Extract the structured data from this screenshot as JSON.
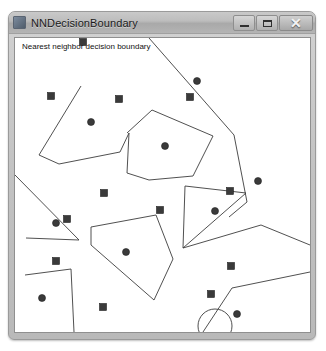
{
  "window": {
    "title": "NNDecisionBoundary",
    "icon": "app-icon",
    "controls": {
      "minimize_label": "–",
      "maximize_label": "□",
      "close_label": "✕"
    }
  },
  "canvas": {
    "label": "Nearest neighbor decision boundary",
    "width": 295,
    "height": 294,
    "background_color": "#ffffff",
    "boundary_color": "#3c3c3c",
    "point_color": "#3a3a3a"
  },
  "chart_data": {
    "type": "scatter",
    "title": "Nearest neighbor decision boundary",
    "xlabel": "",
    "ylabel": "",
    "xlim": [
      0,
      295
    ],
    "ylim": [
      0,
      294
    ],
    "grid": false,
    "legend": "none",
    "series": [
      {
        "name": "class-square",
        "marker": "square",
        "color": "#3a3a3a",
        "size": 7,
        "points": [
          [
            36,
            58
          ],
          [
            104,
            61
          ],
          [
            175,
            59
          ],
          [
            89,
            155
          ],
          [
            145,
            172
          ],
          [
            215,
            153
          ],
          [
            52,
            181
          ],
          [
            41,
            223
          ],
          [
            88,
            269
          ],
          [
            216,
            228
          ],
          [
            196,
            256
          ],
          [
            48,
            322
          ],
          [
            68,
            4
          ]
        ]
      },
      {
        "name": "class-circle",
        "marker": "circle",
        "color": "#3a3a3a",
        "size": 7,
        "points": [
          [
            182,
            43
          ],
          [
            76,
            84
          ],
          [
            150,
            108
          ],
          [
            243,
            143
          ],
          [
            200,
            173
          ],
          [
            41,
            185
          ],
          [
            111,
            214
          ],
          [
            27,
            260
          ],
          [
            222,
            276
          ]
        ]
      }
    ],
    "boundary_paths": [
      "M 134 0 L 219 97 L 232 164 L 214 179",
      "M 66 48 L 24 117 L 44 126 L 105 114 L 114 95 L 112 135 L 134 142 L 178 138 L 198 98 L 137 72 L 112 95",
      "M 0 137 L 64 202 L 11 200",
      "M 76 189 L 141 177 L 158 221 L 139 262 L 76 207 L 76 189",
      "M 170 148 L 231 155 L 168 210 L 170 148",
      "M 168 210 L 246 187 L 295 207",
      "M 10 237 L 56 231 L 59 294",
      "M 217 250 L 295 234",
      "M 217 250 L 188 294"
    ],
    "annotation_circle": {
      "cx": 200,
      "cy": 288,
      "r": 17
    }
  }
}
